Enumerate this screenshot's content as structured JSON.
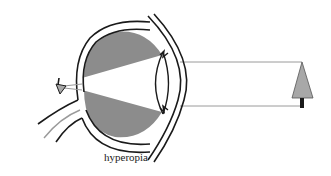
{
  "diagram": {
    "caption": "hyperopia",
    "elements": [
      {
        "name": "eyeball",
        "description": "side view of eyeball with shaded vitreous"
      },
      {
        "name": "lens",
        "description": "biconvex lens behind cornea"
      },
      {
        "name": "cornea",
        "description": "curved front surface"
      },
      {
        "name": "optic-nerve",
        "description": "nerve exiting back of eye"
      },
      {
        "name": "light-rays",
        "description": "two parallel rays from object to eye"
      },
      {
        "name": "object-tree",
        "description": "upright tree object at right"
      },
      {
        "name": "image-tree",
        "description": "inverted image focused behind retina"
      }
    ],
    "colors": {
      "outline": "#1a1a1a",
      "shade": "#8c8c8c",
      "ray": "#9a9a9a",
      "tree": "#a8a8a8",
      "trunk": "#1a1a1a"
    }
  }
}
